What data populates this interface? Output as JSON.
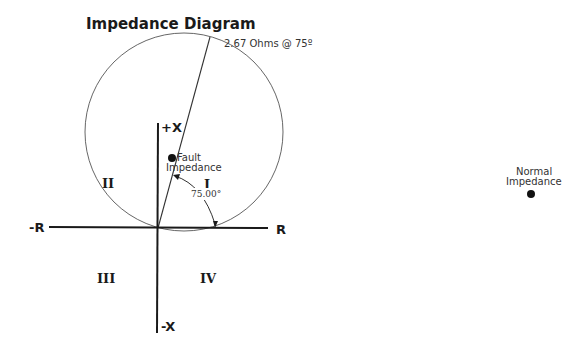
{
  "title": "Impedance Diagram",
  "circle_label": "2.67 Ohms @ 75º",
  "axes": {
    "pos_x": "+X",
    "neg_x": "-X",
    "pos_r": "R",
    "neg_r": "-R"
  },
  "quadrants": {
    "q1": "I",
    "q2": "II",
    "q3": "III",
    "q4": "IV"
  },
  "angle_label": "75.00°",
  "fault_point": {
    "line1": "Fault",
    "line2": "Impedance"
  },
  "normal_point": {
    "line1": "Normal",
    "line2": "Impedance"
  },
  "colors": {
    "line": "#1a1a1a",
    "circle": "#555555"
  }
}
